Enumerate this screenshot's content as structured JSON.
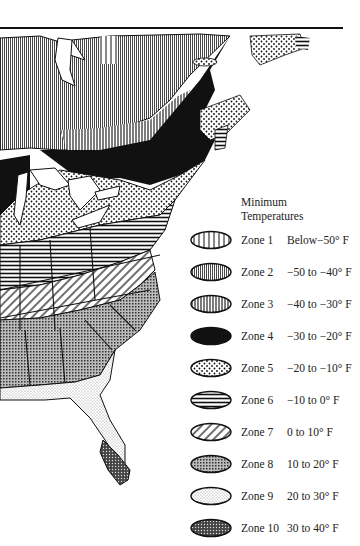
{
  "legend": {
    "title_line1": "Minimum",
    "title_line2": "Temperatures",
    "zones": [
      {
        "zone": "Zone 1",
        "range": "Below−50° F",
        "pattern": "vertical-lines-wide"
      },
      {
        "zone": "Zone 2",
        "range": "−50 to −40° F",
        "pattern": "fine-vertical-gray"
      },
      {
        "zone": "Zone 3",
        "range": "−40 to −30° F",
        "pattern": "vertical-lines-dense"
      },
      {
        "zone": "Zone 4",
        "range": "−30 to −20° F",
        "pattern": "solid-black"
      },
      {
        "zone": "Zone 5",
        "range": "−20 to −10° F",
        "pattern": "dots"
      },
      {
        "zone": "Zone 6",
        "range": "−10 to 0° F",
        "pattern": "horizontal-lines"
      },
      {
        "zone": "Zone 7",
        "range": "0 to 10° F",
        "pattern": "diagonal-lines"
      },
      {
        "zone": "Zone 8",
        "range": "10 to 20° F",
        "pattern": "crosshatch-gray"
      },
      {
        "zone": "Zone 9",
        "range": "20 to 30° F",
        "pattern": "fine-stipple-light"
      },
      {
        "zone": "Zone 10",
        "range": "30 to 40° F",
        "pattern": "dark-crosshatch"
      }
    ]
  },
  "map": {
    "region": "Eastern North America",
    "style_colors": {
      "ink": "#111111",
      "paper": "#ffffff",
      "gray": "#8a8a8a"
    }
  }
}
